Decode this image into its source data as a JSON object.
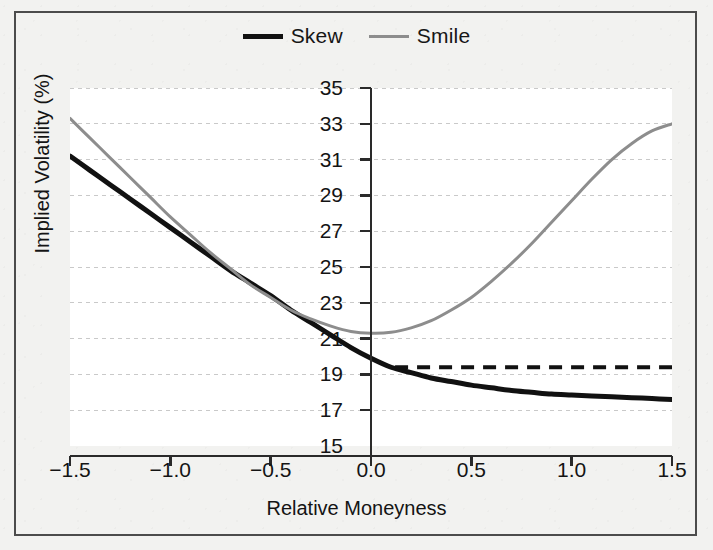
{
  "figure": {
    "background_color": "#f2f2f0",
    "panel_color": "#ffffff",
    "border_color": "#4c4c4c"
  },
  "legend": {
    "position": "top-center",
    "entries": [
      {
        "label": "Skew",
        "color": "#111111",
        "style": "solid",
        "width": 5
      },
      {
        "label": "Smile",
        "color": "#8d8d8d",
        "style": "solid",
        "width": 3
      }
    ]
  },
  "axes": {
    "x_title": "Relative Moneyness",
    "y_title": "Implied Volatility (%)",
    "x_ticks": [
      "−1.5",
      "−1.0",
      "−0.5",
      "0.0",
      "0.5",
      "1.0",
      "1.5"
    ],
    "y_ticks": [
      "35",
      "33",
      "31",
      "29",
      "27",
      "25",
      "23",
      "21",
      "19",
      "17",
      "15"
    ]
  },
  "chart_data": {
    "type": "line",
    "title": "",
    "subtitle": "",
    "xlabel": "Relative Moneyness",
    "ylabel": "Implied Volatility (%)",
    "xlim": [
      -1.5,
      1.5
    ],
    "ylim": [
      15,
      35
    ],
    "xticks": [
      -1.5,
      -1.0,
      -0.5,
      0.0,
      0.5,
      1.0,
      1.5
    ],
    "yticks": [
      15,
      17,
      19,
      21,
      23,
      25,
      27,
      29,
      31,
      33,
      35
    ],
    "grid": "horizontal-dotted",
    "legend_position": "top-center",
    "x": [
      -1.5,
      -1.4,
      -1.3,
      -1.2,
      -1.1,
      -1.0,
      -0.9,
      -0.8,
      -0.7,
      -0.6,
      -0.5,
      -0.4,
      -0.3,
      -0.2,
      -0.1,
      0.0,
      0.1,
      0.2,
      0.3,
      0.4,
      0.5,
      0.6,
      0.7,
      0.8,
      0.9,
      1.0,
      1.1,
      1.2,
      1.3,
      1.4,
      1.5
    ],
    "series": [
      {
        "name": "Skew",
        "color": "#111111",
        "style": "solid",
        "width": 5,
        "values": [
          31.2,
          30.4,
          29.6,
          28.8,
          28.0,
          27.2,
          26.4,
          25.6,
          24.8,
          24.1,
          23.4,
          22.6,
          21.9,
          21.2,
          20.5,
          19.9,
          19.4,
          19.1,
          18.8,
          18.6,
          18.4,
          18.25,
          18.1,
          18.0,
          17.9,
          17.85,
          17.8,
          17.75,
          17.7,
          17.65,
          17.6
        ]
      },
      {
        "name": "Smile",
        "color": "#8d8d8d",
        "style": "solid",
        "width": 3,
        "values": [
          33.3,
          32.2,
          31.1,
          30.0,
          28.9,
          27.8,
          26.8,
          25.8,
          24.9,
          24.0,
          23.3,
          22.6,
          22.1,
          21.7,
          21.4,
          21.3,
          21.35,
          21.6,
          22.0,
          22.6,
          23.3,
          24.2,
          25.2,
          26.3,
          27.5,
          28.7,
          29.9,
          31.0,
          31.9,
          32.6,
          33.0
        ]
      },
      {
        "name": "ATM Level",
        "color": "#111111",
        "style": "dashed",
        "width": 4,
        "x_start": 0.12,
        "x_end": 1.5,
        "value": 19.4
      }
    ]
  }
}
